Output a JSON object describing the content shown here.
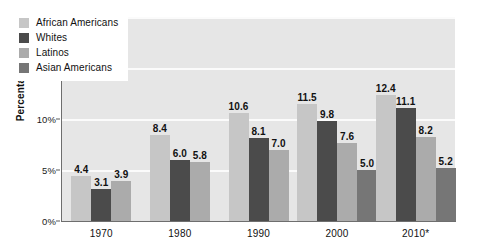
{
  "chart_data": {
    "type": "bar",
    "title": "",
    "subtitle": "",
    "xlabel": "",
    "ylabel": "Percentage",
    "categories": [
      "1970",
      "1980",
      "1990",
      "2000",
      "2010*"
    ],
    "ylim": [
      0,
      20
    ],
    "y_tick_labels": [
      "0%",
      "5%",
      "10%",
      "15%",
      "20%"
    ],
    "y_tick_values": [
      0,
      5,
      10,
      15,
      20
    ],
    "grid": "horizontal",
    "legend_position": "top-left-inside",
    "series": [
      {
        "name": "African Americans",
        "color": "#c6c6c6",
        "values": [
          4.4,
          8.4,
          10.6,
          11.5,
          12.4
        ],
        "value_labels": [
          "4.4",
          "8.4",
          "10.6",
          "11.5",
          "12.4"
        ]
      },
      {
        "name": "Whites",
        "color": "#4b4b4b",
        "values": [
          3.1,
          6.0,
          8.1,
          9.8,
          11.1
        ],
        "value_labels": [
          "3.1",
          "6.0",
          "8.1",
          "9.8",
          "11.1"
        ]
      },
      {
        "name": "Latinos",
        "color": "#ababab",
        "values": [
          3.9,
          5.8,
          7.0,
          7.6,
          8.2
        ],
        "value_labels": [
          "3.9",
          "5.8",
          "7.0",
          "7.6",
          "8.2"
        ]
      },
      {
        "name": "Asian Americans",
        "color": "#767676",
        "values": [
          null,
          null,
          null,
          5.0,
          5.2
        ],
        "value_labels": [
          null,
          null,
          null,
          "5.0",
          "5.2"
        ]
      }
    ],
    "plot_background": "#e6e6e6",
    "gridline_color": "#fbfbfb",
    "axis_color": "#6e6e6e"
  },
  "legend": {
    "entries": [
      {
        "label": "African Americans",
        "swatch": "#c6c6c6"
      },
      {
        "label": "Whites",
        "swatch": "#4b4b4b"
      },
      {
        "label": "Latinos",
        "swatch": "#ababab"
      },
      {
        "label": "Asian Americans",
        "swatch": "#767676"
      }
    ]
  }
}
